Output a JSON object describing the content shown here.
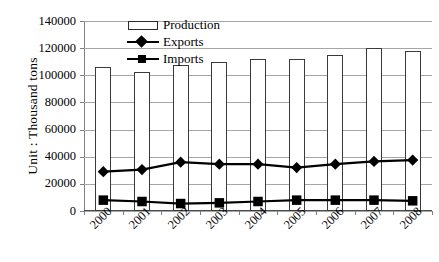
{
  "chart_data": {
    "type": "bar",
    "title": "",
    "subtitle": "",
    "xlabel": "",
    "ylabel": "Unit : Thousand tons",
    "categories": [
      "2000",
      "2001",
      "2002",
      "2003",
      "2004",
      "2005",
      "2006",
      "2007",
      "2008"
    ],
    "ylim": [
      0,
      140000
    ],
    "ytick_values": [
      0,
      20000,
      40000,
      60000,
      80000,
      100000,
      120000,
      140000
    ],
    "ytick_labels": [
      "0",
      "20000",
      "40000",
      "60000",
      "80000",
      "100000",
      "120000",
      "140000"
    ],
    "grid": true,
    "legend_position": "top-center",
    "series": [
      {
        "name": "Production",
        "type": "bar",
        "marker": "none",
        "color": "#ffffff",
        "edge_color": "#3a3a3a",
        "values": [
          106000,
          102500,
          107500,
          110000,
          112000,
          112000,
          115000,
          120000,
          118000
        ]
      },
      {
        "name": "Exports",
        "type": "line",
        "marker": "diamond",
        "color": "#000000",
        "values": [
          29000,
          30500,
          36000,
          34500,
          34500,
          32000,
          34500,
          36500,
          37500
        ]
      },
      {
        "name": "Imports",
        "type": "line",
        "marker": "square",
        "color": "#000000",
        "values": [
          8000,
          7000,
          5500,
          6000,
          7000,
          8000,
          8000,
          8000,
          7500
        ]
      }
    ]
  },
  "legend": {
    "items": [
      {
        "label": "Production",
        "key": "bar-key"
      },
      {
        "label": "Exports",
        "key": "diamond-line-key"
      },
      {
        "label": "Imports",
        "key": "square-line-key"
      }
    ]
  },
  "axes": {
    "y_title": "Unit : Thousand tons"
  }
}
